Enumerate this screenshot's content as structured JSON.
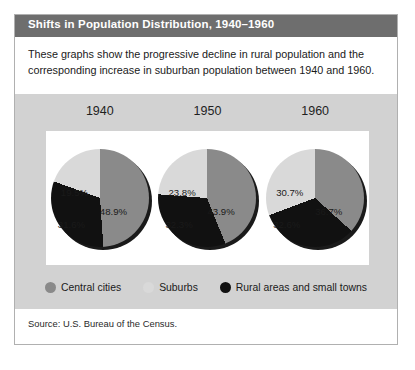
{
  "figure": {
    "title": "Shifts in Population Distribution, 1940–1960",
    "description": "These graphs show the progressive decline in rural population and the corresponding increase in suburban population between 1940 and 1960.",
    "source": "Source: U.S. Bureau of the Census."
  },
  "colors": {
    "central_cities": "#8a8a8a",
    "suburbs": "#d9d9d9",
    "rural": "#111111",
    "band_background": "#d2d2d2",
    "title_bar": "#6e6e6e",
    "panel_border": "#b0b0b0",
    "plot_background": "#ffffff"
  },
  "legend": {
    "items": [
      {
        "label": "Central cities",
        "swatch": "#8a8a8a",
        "key": "central_cities"
      },
      {
        "label": "Suburbs",
        "swatch": "#d9d9d9",
        "key": "suburbs"
      },
      {
        "label": "Rural areas and small towns",
        "swatch": "#111111",
        "key": "rural"
      }
    ]
  },
  "chart_data": {
    "type": "pie",
    "title": "Shifts in Population Distribution, 1940–1960",
    "subtitle": "These graphs show the progressive decline in rural population and the corresponding increase in suburban population between 1940 and 1960.",
    "xlabel": "",
    "ylabel": "",
    "units": "percent of total U.S. population",
    "grid": false,
    "legend_position": "bottom-center",
    "categories": [
      "Central cities",
      "Suburbs",
      "Rural areas and small towns"
    ],
    "panels": [
      {
        "year": "1940",
        "slices": [
          {
            "name": "Central cities",
            "value": 48.9,
            "label": "48.9%"
          },
          {
            "name": "Suburbs",
            "value": 19.5,
            "label": "19.5%"
          },
          {
            "name": "Rural areas and small towns",
            "value": 31.6,
            "label": "31.6%"
          }
        ]
      },
      {
        "year": "1950",
        "slices": [
          {
            "name": "Central cities",
            "value": 43.9,
            "label": "43.9%"
          },
          {
            "name": "Suburbs",
            "value": 23.8,
            "label": "23.8%"
          },
          {
            "name": "Rural areas and small towns",
            "value": 32.3,
            "label": "32.3%"
          }
        ]
      },
      {
        "year": "1960",
        "slices": [
          {
            "name": "Central cities",
            "value": 36.7,
            "label": "36.7%"
          },
          {
            "name": "Suburbs",
            "value": 30.7,
            "label": "30.7%"
          },
          {
            "name": "Rural areas and small towns",
            "value": 32.6,
            "label": "32.6%"
          }
        ]
      }
    ],
    "series": [
      {
        "name": "Central cities",
        "values": [
          48.9,
          43.9,
          36.7
        ]
      },
      {
        "name": "Suburbs",
        "values": [
          19.5,
          23.8,
          30.7
        ]
      },
      {
        "name": "Rural areas and small towns",
        "values": [
          31.6,
          32.3,
          32.6
        ]
      }
    ],
    "x": [
      "1940",
      "1950",
      "1960"
    ]
  }
}
